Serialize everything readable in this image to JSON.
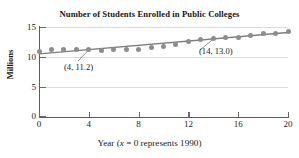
{
  "chart_data": {
    "type": "scatter",
    "title": "Number of Students Enrolled in Public Colleges",
    "xlabel_prefix": "Year (",
    "xlabel_var": "x",
    "xlabel_suffix": " = 0 represents 1990)",
    "xlabel_full": "Year (x = 0 represents 1990)",
    "ylabel": "Millions",
    "xlim": [
      0,
      20
    ],
    "ylim": [
      0,
      15
    ],
    "xticks": [
      0,
      4,
      8,
      12,
      16,
      20
    ],
    "xtick_labels": [
      "0",
      "4",
      "8",
      "12",
      "16",
      "20"
    ],
    "yticks": [
      0,
      5,
      10,
      15
    ],
    "ytick_labels": [
      "0",
      "5",
      "10",
      "15"
    ],
    "grid": true,
    "legend": null,
    "x": [
      0,
      1,
      2,
      3,
      4,
      5,
      6,
      7,
      8,
      9,
      10,
      11,
      12,
      13,
      14,
      15,
      16,
      17,
      18,
      19,
      20
    ],
    "values": [
      10.9,
      11.3,
      11.3,
      11.2,
      11.3,
      11.1,
      11.2,
      11.3,
      11.3,
      11.5,
      11.7,
      12.1,
      12.5,
      12.9,
      13.0,
      13.2,
      13.3,
      13.5,
      13.9,
      13.9,
      14.2
    ],
    "trend_line": {
      "name": "least-squares regression line",
      "p1": [
        0,
        10.48
      ],
      "p2": [
        20,
        14.08
      ],
      "slope": 0.18,
      "intercept": 10.48
    },
    "annotations": [
      {
        "id": "a",
        "label": "(4, 11.2)",
        "point_x": 4,
        "point_y": 11.2
      },
      {
        "id": "b",
        "label": "(14, 13.0)",
        "point_x": 14,
        "point_y": 13.0
      }
    ],
    "colors": {
      "marker": "#8d8d8d",
      "line": "#7c7c7c",
      "axis": "#5b5b5b",
      "grid": "#dcdcdc",
      "text": "#1b1b1b"
    }
  }
}
